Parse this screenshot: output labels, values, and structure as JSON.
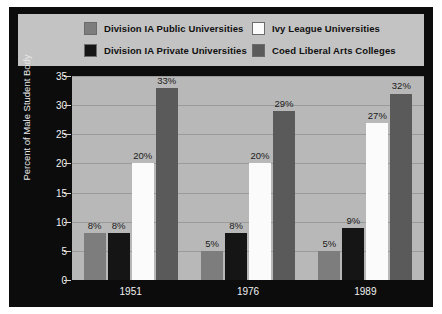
{
  "chart_data": {
    "type": "bar",
    "title": "",
    "xlabel": "",
    "ylabel": "Percent of Male Student Body",
    "categories": [
      "1951",
      "1976",
      "1989"
    ],
    "ylim": [
      0,
      35
    ],
    "yticks": [
      0,
      5,
      10,
      15,
      20,
      25,
      30,
      35
    ],
    "ytick_labels": [
      "0",
      "5",
      "10",
      "15",
      "20",
      "25",
      "30",
      "35"
    ],
    "grid": true,
    "legend_position": "top",
    "value_suffix": "%",
    "series": [
      {
        "name": "Division IA Public Universities",
        "color": "#7d7d7d",
        "values": [
          8,
          5,
          5
        ],
        "labels": [
          "8%",
          "5%",
          "5%"
        ]
      },
      {
        "name": "Division IA Private Universities",
        "color": "#151515",
        "values": [
          8,
          8,
          9
        ],
        "labels": [
          "8%",
          "8%",
          "9%"
        ]
      },
      {
        "name": "Ivy League Universities",
        "color": "#fbfbfb",
        "values": [
          20,
          20,
          27
        ],
        "labels": [
          "20%",
          "20%",
          "27%"
        ]
      },
      {
        "name": "Coed Liberal Arts Colleges",
        "color": "#5a5a5a",
        "values": [
          33,
          29,
          32
        ],
        "labels": [
          "33%",
          "29%",
          "32%"
        ]
      }
    ]
  },
  "colors": {
    "figure_background": "#0c0c0c",
    "plot_background": "#b8b8b8",
    "legend_background": "#c3c3c3",
    "gridline": "#9a9a9a",
    "axis_text": "#f0f0f0",
    "label_text": "#1a1a1a"
  }
}
